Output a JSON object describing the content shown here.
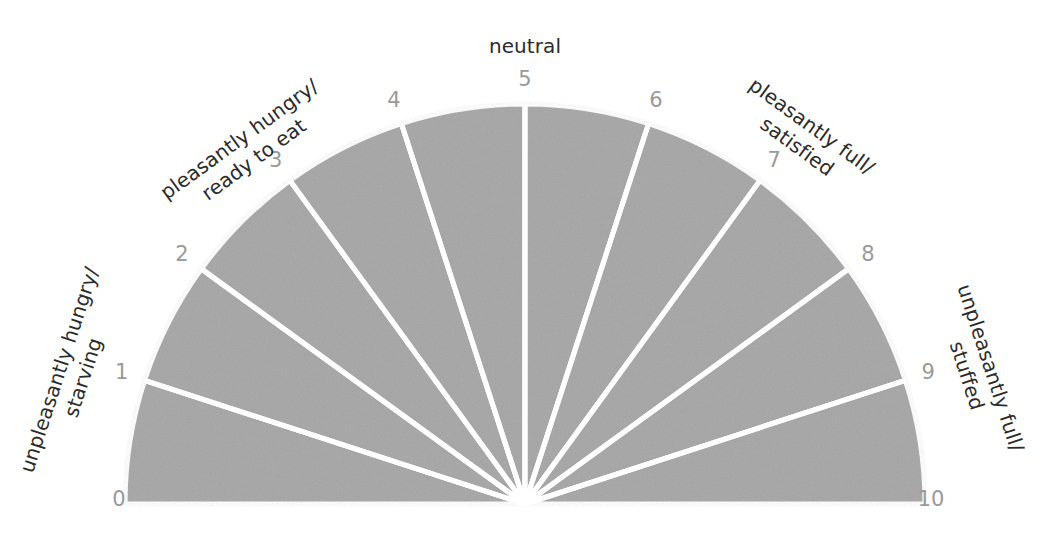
{
  "figure": {
    "title_visible": false,
    "background_color": "#ffffff",
    "segment_fill_color": "#ababab",
    "segment_divider_color": "#ffffff",
    "tick_number_color": "#9a9a9a",
    "zone_label_color": "#2b2b2b"
  },
  "chart_data": {
    "type": "pie",
    "title": "",
    "xlabel": "",
    "ylabel": "",
    "subtype": "semicircular-gauge-scale",
    "center": {
      "x": 525,
      "y": 504
    },
    "radius": 400,
    "label_radius": 424,
    "start_angle_deg": 180,
    "end_angle_deg": 0,
    "segment_count": 10,
    "segment_angle_deg": 18,
    "values": [
      1,
      1,
      1,
      1,
      1,
      1,
      1,
      1,
      1,
      1
    ],
    "categories": [
      "0-1",
      "1-2",
      "2-3",
      "3-4",
      "4-5",
      "5-6",
      "6-7",
      "7-8",
      "8-9",
      "9-10"
    ],
    "tick_labels": [
      "0",
      "1",
      "2",
      "3",
      "4",
      "5",
      "6",
      "7",
      "8",
      "9",
      "10"
    ],
    "tick_angles_deg": [
      180,
      162,
      144,
      126,
      108,
      90,
      72,
      54,
      36,
      18,
      0
    ],
    "grid": false,
    "legend": false,
    "annotations": [
      {
        "id": "neutral",
        "text": "neutral",
        "anchor_tick": "5",
        "position": "top-center"
      },
      {
        "id": "unpleasantly-hungry",
        "line1": "unpleasantly hungry/",
        "line2": "starving",
        "anchor_tick": "0-1",
        "position": "left"
      },
      {
        "id": "pleasantly-hungry",
        "line1": "pleasantly hungry/",
        "line2": "ready to eat",
        "anchor_tick": "3",
        "position": "upper-left"
      },
      {
        "id": "pleasantly-full",
        "line1": "pleasantly full/",
        "line2": "satisfied",
        "anchor_tick": "7",
        "position": "upper-right"
      },
      {
        "id": "unpleasantly-full",
        "line1": "unpleasantly full/",
        "line2": "stuffed",
        "anchor_tick": "9-10",
        "position": "right"
      }
    ]
  },
  "ticks": {
    "t0": "0",
    "t1": "1",
    "t2": "2",
    "t3": "3",
    "t4": "4",
    "t5": "5",
    "t6": "6",
    "t7": "7",
    "t8": "8",
    "t9": "9",
    "t10": "10"
  },
  "labels": {
    "neutral": "neutral",
    "unpleasantly_hungry_line1": "unpleasantly hungry/",
    "unpleasantly_hungry_line2": "starving",
    "pleasantly_hungry_line1": "pleasantly hungry/",
    "pleasantly_hungry_line2": "ready to eat",
    "pleasantly_full_line1": "pleasantly full/",
    "pleasantly_full_line2": "satisfied",
    "unpleasantly_full_line1": "unpleasantly full/",
    "unpleasantly_full_line2": "stuffed"
  }
}
